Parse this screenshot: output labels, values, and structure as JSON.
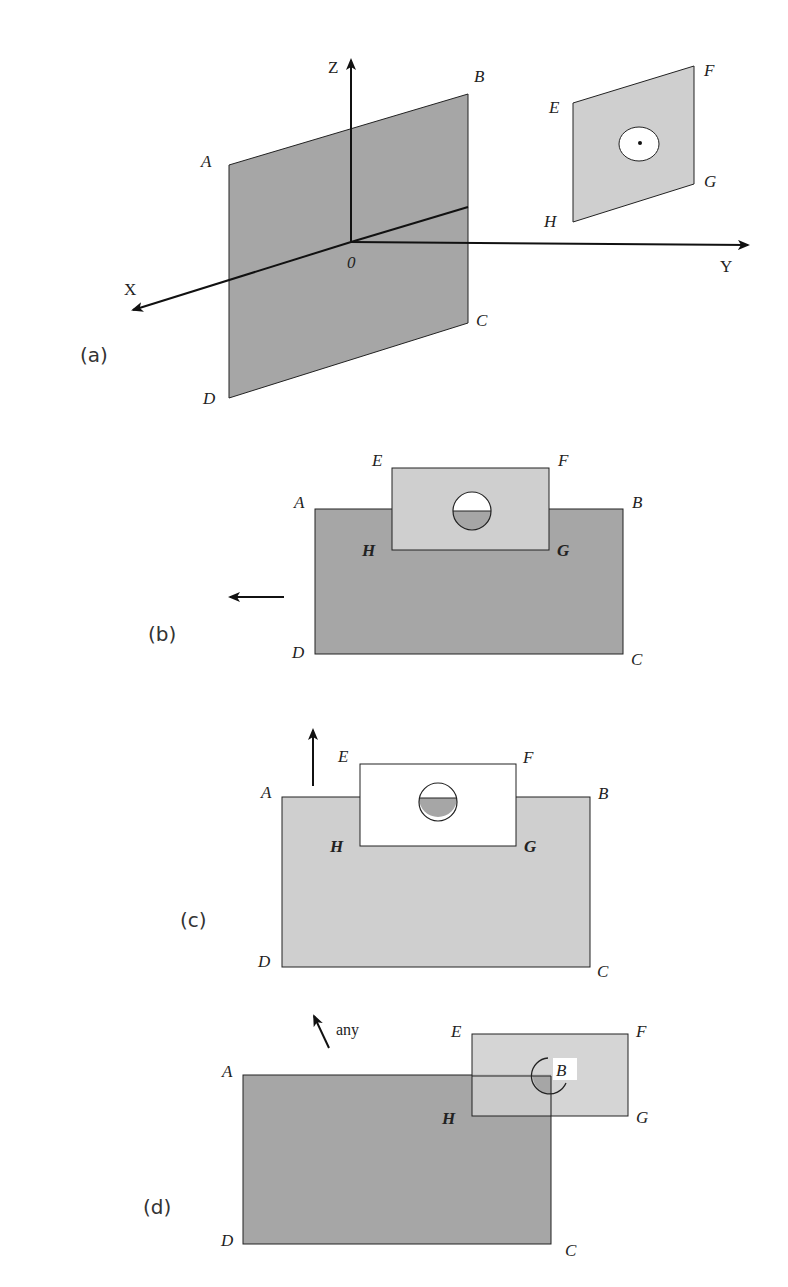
{
  "colors": {
    "dark_plate": "#a6a6a6",
    "light_plate": "#cfcfcf",
    "white": "#ffffff",
    "stroke": "#222222"
  },
  "panel_a": {
    "label": "(a)",
    "axes": {
      "x": "X",
      "y": "Y",
      "z": "Z",
      "origin": "0"
    },
    "plate1": {
      "A": "A",
      "B": "B",
      "C": "C",
      "D": "D"
    },
    "plate2": {
      "E": "E",
      "F": "F",
      "G": "G",
      "H": "H"
    }
  },
  "panel_b": {
    "label": "(b)",
    "vertices": {
      "A": "A",
      "B": "B",
      "C": "C",
      "D": "D",
      "E": "E",
      "F": "F",
      "G": "G",
      "H": "H"
    },
    "arrow_direction": "left"
  },
  "panel_c": {
    "label": "(c)",
    "vertices": {
      "A": "A",
      "B": "B",
      "C": "C",
      "D": "D",
      "E": "E",
      "F": "F",
      "G": "G",
      "H": "H"
    },
    "arrow_direction": "up"
  },
  "panel_d": {
    "label": "(d)",
    "vertices": {
      "A": "A",
      "C": "C",
      "D": "D",
      "E": "E",
      "F": "F",
      "G": "G",
      "H": "H"
    },
    "corner_marker": "B",
    "arrow_note": "any"
  }
}
